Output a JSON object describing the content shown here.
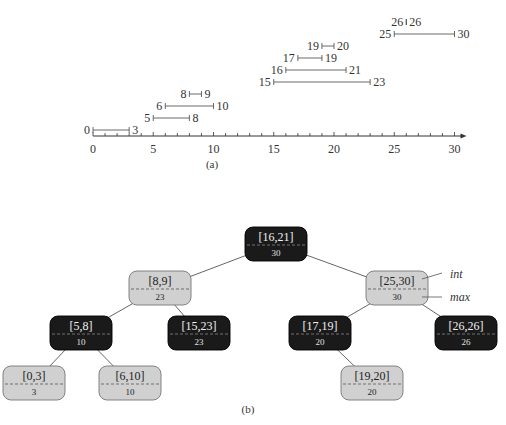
{
  "figure_a": {
    "caption": "(a)",
    "axis": {
      "min": 0,
      "max": 30,
      "major_ticks": [
        0,
        5,
        10,
        15,
        20,
        25,
        30
      ],
      "minor_tick_step": 1
    },
    "intervals": [
      {
        "low": 0,
        "high": 3
      },
      {
        "low": 5,
        "high": 8
      },
      {
        "low": 6,
        "high": 10
      },
      {
        "low": 8,
        "high": 9
      },
      {
        "low": 15,
        "high": 23
      },
      {
        "low": 16,
        "high": 21
      },
      {
        "low": 17,
        "high": 19
      },
      {
        "low": 19,
        "high": 20
      },
      {
        "low": 25,
        "high": 30
      },
      {
        "low": 26,
        "high": 26
      }
    ]
  },
  "figure_b": {
    "caption": "(b)",
    "legend": {
      "int_label": "int",
      "max_label": "max"
    },
    "colors": {
      "black_node": "#1a1a1a",
      "gray_node": "#d0d0d0",
      "edge": "#555555"
    },
    "nodes": [
      {
        "id": "n16_21",
        "interval": "[16,21]",
        "max": "30",
        "color": "black",
        "parent": null
      },
      {
        "id": "n8_9",
        "interval": "[8,9]",
        "max": "23",
        "color": "gray",
        "parent": "n16_21"
      },
      {
        "id": "n25_30",
        "interval": "[25,30]",
        "max": "30",
        "color": "gray",
        "parent": "n16_21"
      },
      {
        "id": "n5_8",
        "interval": "[5,8]",
        "max": "10",
        "color": "black",
        "parent": "n8_9"
      },
      {
        "id": "n15_23",
        "interval": "[15,23]",
        "max": "23",
        "color": "black",
        "parent": "n8_9"
      },
      {
        "id": "n17_19",
        "interval": "[17,19]",
        "max": "20",
        "color": "black",
        "parent": "n25_30"
      },
      {
        "id": "n26_26",
        "interval": "[26,26]",
        "max": "26",
        "color": "black",
        "parent": "n25_30"
      },
      {
        "id": "n0_3",
        "interval": "[0,3]",
        "max": "3",
        "color": "gray",
        "parent": "n5_8"
      },
      {
        "id": "n6_10",
        "interval": "[6,10]",
        "max": "10",
        "color": "gray",
        "parent": "n5_8"
      },
      {
        "id": "n19_20",
        "interval": "[19,20]",
        "max": "20",
        "color": "gray",
        "parent": "n17_19"
      }
    ]
  }
}
